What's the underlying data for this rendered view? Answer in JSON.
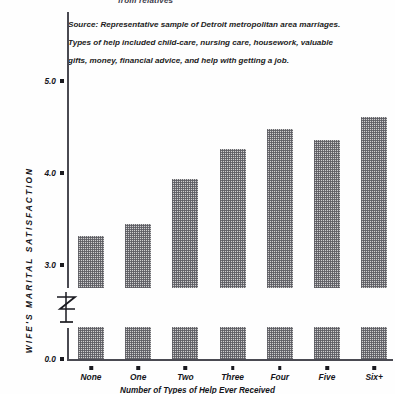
{
  "figure": {
    "title_fragment": "from relatives",
    "source_note_lines": [
      "Source: Representative sample of Detroit metropolitan area  marriages.",
      "Types of help included child-care, nursing care, housework, valuable",
      "gifts, money, financial advice, and help with getting a job."
    ]
  },
  "chart_data": {
    "type": "bar",
    "title": "",
    "categories": [
      "None",
      "One",
      "Two",
      "Three",
      "Four",
      "Five",
      "Six+"
    ],
    "values": [
      3.32,
      3.45,
      3.93,
      4.26,
      4.48,
      4.36,
      4.61
    ],
    "xlabel": "Number of Types of Help Ever Received",
    "ylabel": "WIFE'S MARITAL SATISFACTION",
    "ytick_labels": [
      "0.0",
      "3.0",
      "4.0",
      "5.0"
    ],
    "ytick_values": [
      0.0,
      3.0,
      4.0,
      5.0
    ],
    "ylim": [
      0.0,
      5.3
    ],
    "axis_break": true,
    "axis_break_range": [
      0.35,
      2.7
    ],
    "grid": false,
    "legend": "none",
    "bar_fill": "stippled-gray",
    "bar_color": "#cfcfcf"
  }
}
